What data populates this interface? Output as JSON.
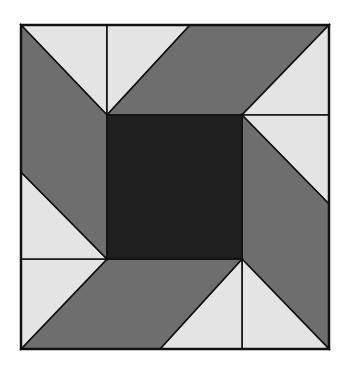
{
  "colors": {
    "background": "#ffffff",
    "light": "#e4e4e4",
    "medium": "#6e6e6e",
    "dark": "#1f1f1f",
    "stroke": "#111111"
  },
  "block": {
    "outer": {
      "x": 21,
      "y": 25,
      "w": 308,
      "h": 324
    },
    "center": {
      "x": 107,
      "y": 115,
      "w": 135,
      "h": 144
    }
  },
  "pieces": [
    {
      "name": "top-left-light-triangle",
      "fill": "light",
      "points": "21,25 107,25 107,115"
    },
    {
      "name": "top-mid-light-triangle",
      "fill": "light",
      "points": "107,25 190,25 107,115"
    },
    {
      "name": "top-right-medium-parallelogram",
      "fill": "medium",
      "points": "190,25 329,25 242,115 107,115"
    },
    {
      "name": "top-right-light-triangle",
      "fill": "light",
      "points": "329,25 329,115 242,115"
    },
    {
      "name": "right-upper-light-triangle",
      "fill": "light",
      "points": "242,115 329,115 329,204"
    },
    {
      "name": "right-medium-parallelogram",
      "fill": "medium",
      "points": "242,115 329,204 329,349 242,259"
    },
    {
      "name": "bottom-right-light-triangle",
      "fill": "light",
      "points": "242,259 329,349 242,349"
    },
    {
      "name": "bottom-mid-light-triangle",
      "fill": "light",
      "points": "242,259 242,349 160,349"
    },
    {
      "name": "bottom-left-medium-parallelogram",
      "fill": "medium",
      "points": "107,259 242,259 160,349 21,349"
    },
    {
      "name": "bottom-left-light-triangle",
      "fill": "light",
      "points": "21,259 107,259 21,349"
    },
    {
      "name": "left-lower-light-triangle",
      "fill": "light",
      "points": "21,172 107,259 21,259"
    },
    {
      "name": "left-medium-parallelogram",
      "fill": "medium",
      "points": "21,25 107,115 107,259 21,172"
    },
    {
      "name": "center-dark-square",
      "fill": "dark",
      "points": "107,115 242,115 242,259 107,259"
    }
  ]
}
